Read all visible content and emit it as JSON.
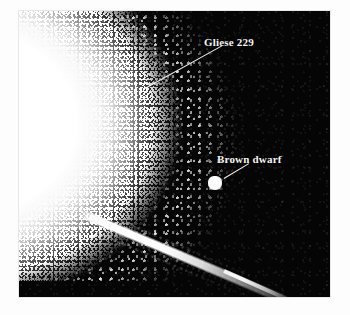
{
  "figure": {
    "kind": "astronomical-photograph",
    "background_color": "#fdfdfd",
    "plate_color": "#050505",
    "annotation_color": "#f4f4f4"
  },
  "annotations": [
    {
      "id": "gliese",
      "label": "Gliese 229",
      "target": "stellar-glare",
      "leader_icon": "leader-line-icon"
    },
    {
      "id": "brown_dwarf",
      "label": "Brown dwarf",
      "target": "point-source",
      "leader_icon": "leader-line-icon"
    }
  ],
  "objects": {
    "primary_star": "Gliese 229",
    "companion": "Brown dwarf",
    "diffraction_spike": "diffraction-spike"
  }
}
